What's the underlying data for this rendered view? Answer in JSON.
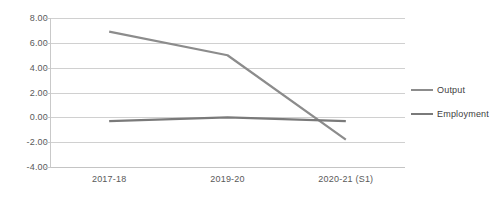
{
  "chart_data": {
    "type": "line",
    "title": "",
    "subtitle": "",
    "xlabel": "",
    "ylabel": "",
    "categories": [
      "2017-18",
      "2019-20",
      "2020-21 (S1)"
    ],
    "series": [
      {
        "name": "Output",
        "values": [
          6.9,
          5.0,
          -1.8
        ],
        "color": "#808080"
      },
      {
        "name": "Employment",
        "values": [
          -0.3,
          0.0,
          -0.3
        ],
        "color": "#7f7f7f"
      }
    ],
    "ylim": [
      -4.0,
      8.0
    ],
    "y_ticks": [
      8.0,
      6.0,
      4.0,
      2.0,
      0.0,
      -2.0,
      -4.0
    ],
    "y_tick_labels": [
      "8.00",
      "6.00",
      "4.00",
      "2.00",
      "0.00",
      "-2.00",
      "-4.00"
    ],
    "grid": true,
    "legend_position": "right"
  },
  "legend": {
    "items": [
      {
        "label": "Output"
      },
      {
        "label": "Employment"
      }
    ]
  },
  "axis": {
    "y_tick_labels": [
      "8.00",
      "6.00",
      "4.00",
      "2.00",
      "0.00",
      "-2.00",
      "-4.00"
    ],
    "x_tick_labels": [
      "2017-18",
      "2019-20",
      "2020-21 (S1)"
    ]
  },
  "colors": {
    "series_output": "#8c8c8c",
    "series_employment": "#7a7a7a",
    "gridline": "#d0d0d0",
    "axis_text": "#595959"
  }
}
